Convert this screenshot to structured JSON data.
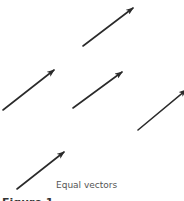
{
  "caption": "Equal vectors",
  "figure_label": "Figure 1",
  "colors": {
    "vector": "#2a2a2a",
    "caption": "#555555"
  },
  "vectors": [
    {
      "name": "vector-1",
      "x1": 83,
      "y1": 46,
      "x2": 133,
      "y2": 8
    },
    {
      "name": "vector-2",
      "x1": 3,
      "y1": 110,
      "x2": 54,
      "y2": 70
    },
    {
      "name": "vector-3",
      "x1": 73,
      "y1": 108,
      "x2": 122,
      "y2": 72
    },
    {
      "name": "vector-4",
      "x1": 138,
      "y1": 130,
      "x2": 186,
      "y2": 90
    },
    {
      "name": "vector-5",
      "x1": 17,
      "y1": 189,
      "x2": 64,
      "y2": 152
    }
  ]
}
